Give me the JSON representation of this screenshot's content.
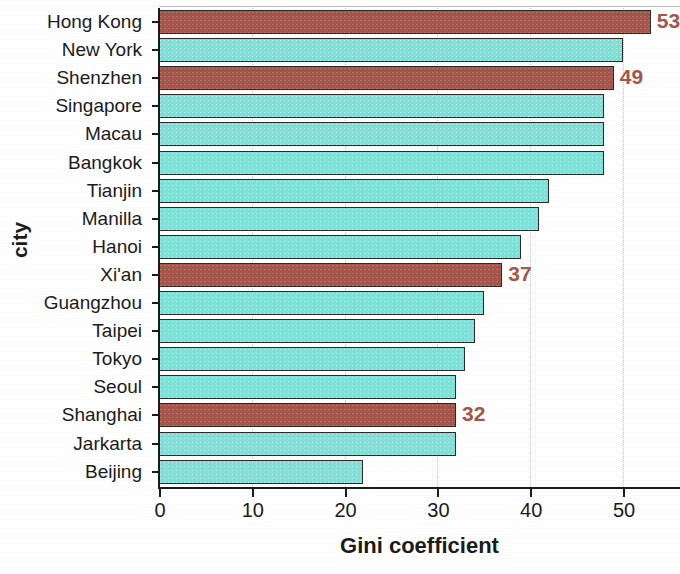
{
  "chart_data": {
    "type": "bar",
    "orientation": "horizontal",
    "title": "",
    "xlabel": "Gini coefficient",
    "ylabel": "city",
    "xlim": [
      0,
      56
    ],
    "xticks": [
      0,
      10,
      20,
      30,
      40,
      50
    ],
    "grid": "vertical-dotted",
    "legend": "none",
    "categories": [
      "Hong Kong",
      "New York",
      "Shenzhen",
      "Singapore",
      "Macau",
      "Bangkok",
      "Tianjin",
      "Manilla",
      "Hanoi",
      "Xi'an",
      "Guangzhou",
      "Taipei",
      "Tokyo",
      "Seoul",
      "Shanghai",
      "Jarkarta",
      "Beijing"
    ],
    "values": [
      53,
      50,
      49,
      48,
      48,
      48,
      42,
      41,
      39,
      37,
      35,
      34,
      33,
      32,
      32,
      32,
      22
    ],
    "highlighted": [
      true,
      false,
      true,
      false,
      false,
      false,
      false,
      false,
      false,
      true,
      false,
      false,
      false,
      false,
      true,
      false,
      false
    ],
    "data_labels": [
      "53",
      "",
      "49",
      "",
      "",
      "",
      "",
      "",
      "",
      "37",
      "",
      "",
      "",
      "",
      "32",
      "",
      ""
    ],
    "colors": {
      "bar_default": "#7fe0d8",
      "bar_highlight": "#a4564a",
      "bar_outline": "#2a2a2a",
      "label_text": "#a4564a",
      "axis_text": "#1b1b1b",
      "gridline": "#c9c9c9",
      "background": "#ffffff"
    }
  }
}
